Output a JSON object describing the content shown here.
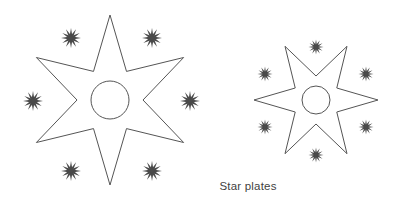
{
  "figure": {
    "background_color": "#ffffff",
    "width": 397,
    "height": 201,
    "caption": "Star plates",
    "caption_color": "#3f3f3f",
    "outline_color": "#555555",
    "sparkle_color": "#4a4a4a",
    "stroke_width": 1
  },
  "shapes": {
    "left_star": {
      "name": "large-star-plate",
      "center_x": 110,
      "center_y": 100,
      "outer_radius": 85,
      "inner_radius": 33,
      "points": 6,
      "rotation_deg": 0,
      "hole_radius": 19
    },
    "right_star": {
      "name": "small-star-plate",
      "center_x": 316,
      "center_y": 100,
      "outer_radius": 62,
      "inner_radius": 24,
      "points": 6,
      "rotation_deg": 30,
      "hole_radius": 14
    }
  },
  "sparkles": {
    "rays": 12,
    "left_star_group": [
      {
        "x": 71,
        "y": 38,
        "size": 20
      },
      {
        "x": 152,
        "y": 38,
        "size": 20
      },
      {
        "x": 33,
        "y": 101,
        "size": 20
      },
      {
        "x": 190,
        "y": 101,
        "size": 20
      },
      {
        "x": 71,
        "y": 171,
        "size": 20
      },
      {
        "x": 152,
        "y": 171,
        "size": 20
      }
    ],
    "right_star_group": [
      {
        "x": 316,
        "y": 47,
        "size": 15
      },
      {
        "x": 265,
        "y": 74,
        "size": 15
      },
      {
        "x": 366,
        "y": 74,
        "size": 15
      },
      {
        "x": 265,
        "y": 127,
        "size": 15
      },
      {
        "x": 366,
        "y": 127,
        "size": 15
      },
      {
        "x": 316,
        "y": 155,
        "size": 15
      }
    ]
  },
  "caption_position": {
    "x": 248,
    "y": 190
  }
}
